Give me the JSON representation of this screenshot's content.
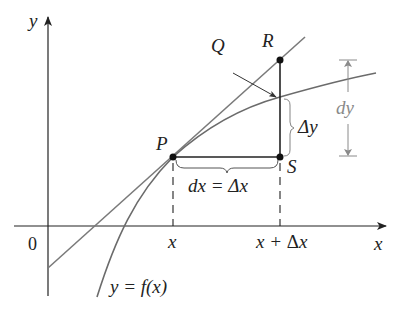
{
  "diagram": {
    "axes": {
      "x_label": "x",
      "y_label": "y",
      "origin_label": "0"
    },
    "points": {
      "P": "P",
      "Q": "Q",
      "R": "R",
      "S": "S"
    },
    "ticks": {
      "x": "x",
      "x_plus_dx_prefix": "x + ",
      "delta": "Δ",
      "x_suffix": "x"
    },
    "annotations": {
      "dx_eq": "dx = Δx",
      "dx_left": "dx = ",
      "delta_y": "Δy",
      "dy": "dy",
      "function": "y = f(x)"
    },
    "colors": {
      "curve": "#6b6b6b",
      "tangent": "#7a7a7a",
      "axes": "#222222",
      "dy_annotation": "#8a8a8a",
      "points": "#111111"
    }
  }
}
